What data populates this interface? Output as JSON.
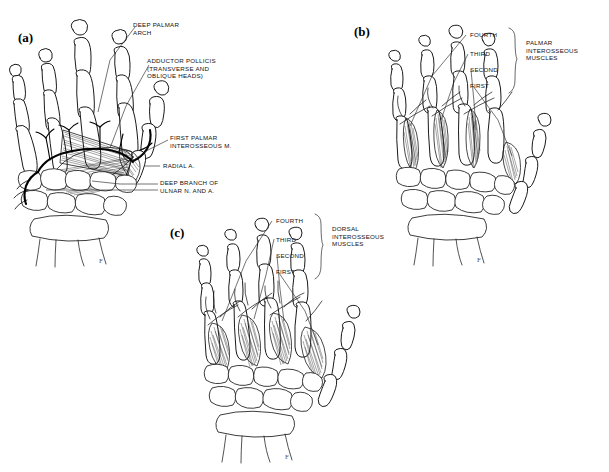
{
  "figure": {
    "background": "#ffffff",
    "ink": "#1a1a1a",
    "width": 609,
    "height": 472
  },
  "panels": [
    {
      "id": "a",
      "letter": "(a)",
      "view": "palmar deep dissection",
      "labels": [
        {
          "key": "deep_palmar_arch",
          "text": "DEEP PALMAR\nARCH",
          "align": "left"
        },
        {
          "key": "adductor_pollicis",
          "text": "ADDUCTOR POLLICIS\n(TRANSVERSE AND\nOBLIQUE HEADS)",
          "align": "left"
        },
        {
          "key": "first_palmar_interosseous",
          "text": "FIRST PALMAR\nINTEROSSEOUS M.",
          "align": "left"
        },
        {
          "key": "radial_artery",
          "text": "RADIAL A.",
          "align": "left"
        },
        {
          "key": "deep_branch_ulnar",
          "text": "DEEP BRANCH OF\nULNAR N. AND A.",
          "align": "left"
        }
      ]
    },
    {
      "id": "b",
      "letter": "(b)",
      "view": "palmar interossei",
      "numbered": [
        "FOURTH",
        "THIRD",
        "SECOND",
        "FIRST"
      ],
      "group_label": "PALMAR\nINTEROSSEOUS\nMUSCLES"
    },
    {
      "id": "c",
      "letter": "(c)",
      "view": "dorsal interossei",
      "numbered": [
        "FOURTH",
        "THIRD",
        "SECOND",
        "FIRST"
      ],
      "group_label": "DORSAL\nINTEROSSEOUS\nMUSCLES"
    }
  ],
  "panel_a_labels": {
    "deep_palmar_arch": "DEEP PALMAR\nARCH",
    "adductor_pollicis": "ADDUCTOR POLLICIS\n(TRANSVERSE AND\nOBLIQUE HEADS)",
    "first_palmar_interosseous": "FIRST PALMAR\nINTEROSSEOUS M.",
    "radial_artery": "RADIAL A.",
    "deep_branch_ulnar": "DEEP BRANCH OF\nULNAR N. AND A.",
    "letter": "(a)"
  },
  "panel_b_labels": {
    "letter": "(b)",
    "fourth": "FOURTH",
    "third": "THIRD",
    "second": "SECOND",
    "first": "FIRST",
    "group": "PALMAR\nINTEROSSEOUS\nMUSCLES"
  },
  "panel_c_labels": {
    "letter": "(c)",
    "fourth": "FOURTH",
    "third": "THIRD",
    "second": "SECOND",
    "first": "FIRST",
    "group": "DORSAL\nINTEROSSEOUS\nMUSCLES"
  }
}
